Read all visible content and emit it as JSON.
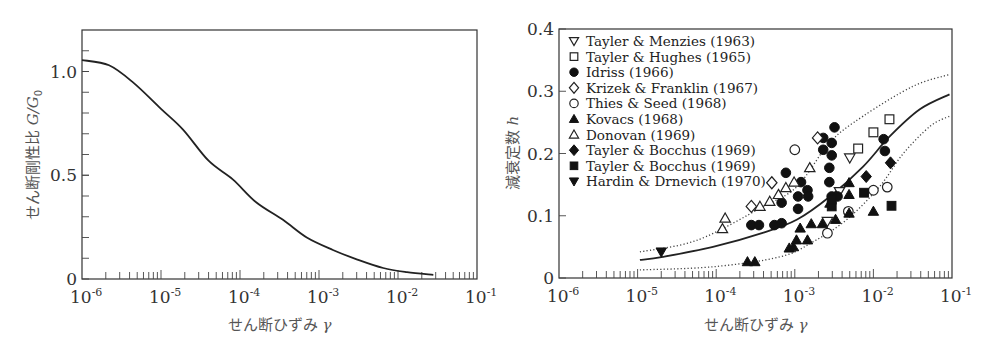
{
  "chart_data": [
    {
      "type": "line",
      "title": "",
      "xlabel": "せん断ひずみ γ",
      "ylabel": "せん断剛性比 G/G0",
      "ylabel_parts": {
        "text": "せん断剛性比 ",
        "var": "G/G",
        "sub": "0"
      },
      "xlabel_parts": {
        "text": "せん断ひずみ ",
        "var": "γ"
      },
      "xscale": "log",
      "xlim": [
        1e-06,
        0.1
      ],
      "ylim": [
        0,
        1.2
      ],
      "xticks": [
        {
          "base": "10",
          "exp": "-6"
        },
        {
          "base": "10",
          "exp": "-5"
        },
        {
          "base": "10",
          "exp": "-4"
        },
        {
          "base": "10",
          "exp": "-3"
        },
        {
          "base": "10",
          "exp": "-2"
        },
        {
          "base": "10",
          "exp": "-1"
        }
      ],
      "yticks": [
        {
          "value": 0,
          "label": "0"
        },
        {
          "value": 0.5,
          "label": "0.5"
        },
        {
          "value": 1.0,
          "label": "1.0"
        }
      ],
      "y_minor_step": 0.1,
      "grid": false,
      "series": [
        {
          "name": "G/G0",
          "style": "solid",
          "points": [
            [
              1e-06,
              1.055
            ],
            [
              2.2e-06,
              1.03
            ],
            [
              4.5e-06,
              0.945
            ],
            [
              1e-05,
              0.82
            ],
            [
              1.9e-05,
              0.72
            ],
            [
              4e-05,
              0.57
            ],
            [
              8.1e-05,
              0.48
            ],
            [
              0.00016,
              0.37
            ],
            [
              0.00035,
              0.285
            ],
            [
              0.0007,
              0.2
            ],
            [
              0.0015,
              0.14
            ],
            [
              0.003,
              0.095
            ],
            [
              0.0065,
              0.053
            ],
            [
              0.013,
              0.033
            ],
            [
              0.028,
              0.02
            ]
          ]
        }
      ]
    },
    {
      "type": "scatter",
      "title": "",
      "xlabel": "せん断ひずみ γ",
      "ylabel": "減衰定数 h",
      "ylabel_parts": {
        "text": "減衰定数 ",
        "var": "h"
      },
      "xlabel_parts": {
        "text": "せん断ひずみ ",
        "var": "γ"
      },
      "xscale": "log",
      "xlim": [
        1e-06,
        0.1
      ],
      "ylim": [
        0,
        0.4
      ],
      "xticks": [
        {
          "base": "10",
          "exp": "-6"
        },
        {
          "base": "10",
          "exp": "-5"
        },
        {
          "base": "10",
          "exp": "-4"
        },
        {
          "base": "10",
          "exp": "-3"
        },
        {
          "base": "10",
          "exp": "-2"
        },
        {
          "base": "10",
          "exp": "-1"
        }
      ],
      "yticks": [
        {
          "value": 0,
          "label": "0"
        },
        {
          "value": 0.1,
          "label": "0.1"
        },
        {
          "value": 0.2,
          "label": "0.2"
        },
        {
          "value": 0.3,
          "label": "0.3"
        },
        {
          "value": 0.4,
          "label": "0.4"
        }
      ],
      "grid": false,
      "legend_position": "top-left",
      "curves": [
        {
          "name": "mean",
          "style": "solid",
          "points": [
            [
              1.07e-05,
              0.029
            ],
            [
              2.1e-05,
              0.034
            ],
            [
              9.1e-05,
              0.05
            ],
            [
              0.0004,
              0.073
            ],
            [
              0.00107,
              0.094
            ],
            [
              0.0028,
              0.131
            ],
            [
              0.0074,
              0.179
            ],
            [
              0.016,
              0.227
            ],
            [
              0.039,
              0.271
            ],
            [
              0.093,
              0.295
            ]
          ]
        },
        {
          "name": "upper bound",
          "style": "dotted",
          "points": [
            [
              1.07e-05,
              0.042
            ],
            [
              5.8e-05,
              0.061
            ],
            [
              0.0004,
              0.115
            ],
            [
              0.00107,
              0.147
            ],
            [
              0.0028,
              0.218
            ],
            [
              0.0074,
              0.26
            ],
            [
              0.032,
              0.308
            ],
            [
              0.093,
              0.327
            ]
          ]
        },
        {
          "name": "lower bound",
          "style": "dotted",
          "points": [
            [
              1.07e-05,
              0.013
            ],
            [
              9.1e-05,
              0.018
            ],
            [
              0.00065,
              0.034
            ],
            [
              0.0017,
              0.058
            ],
            [
              0.0046,
              0.094
            ],
            [
              0.012,
              0.147
            ],
            [
              0.024,
              0.2
            ],
            [
              0.053,
              0.244
            ],
            [
              0.093,
              0.26
            ]
          ]
        }
      ],
      "series": [
        {
          "name": "Tayler & Menzies (1963)",
          "marker": "triangle-down-open",
          "points": [
            [
              0.005,
              0.193
            ],
            [
              0.0026,
              0.091
            ],
            [
              0.0037,
              0.139
            ]
          ]
        },
        {
          "name": "Tayler & Hughes (1965)",
          "marker": "square-open",
          "points": [
            [
              0.016,
              0.255
            ],
            [
              0.01,
              0.234
            ],
            [
              0.0064,
              0.208
            ]
          ]
        },
        {
          "name": "Idriss (1966)",
          "marker": "circle-filled",
          "points": [
            [
              0.0032,
              0.242
            ],
            [
              0.0023,
              0.225
            ],
            [
              0.00295,
              0.217
            ],
            [
              0.0023,
              0.206
            ],
            [
              0.00295,
              0.197
            ],
            [
              0.00275,
              0.177
            ],
            [
              0.00275,
              0.154
            ],
            [
              0.00077,
              0.169
            ],
            [
              0.0012,
              0.154
            ],
            [
              0.00145,
              0.141
            ],
            [
              0.00148,
              0.131
            ],
            [
              0.0011,
              0.131
            ],
            [
              0.00068,
              0.121
            ],
            [
              0.0011,
              0.111
            ],
            [
              0.00028,
              0.085
            ],
            [
              0.00035,
              0.085
            ],
            [
              0.00055,
              0.085
            ],
            [
              0.00068,
              0.088
            ],
            [
              0.00295,
              0.131
            ],
            [
              0.0035,
              0.131
            ],
            [
              0.0135,
              0.223
            ],
            [
              0.014,
              0.204
            ]
          ]
        },
        {
          "name": "Krizek & Franklin (1967)",
          "marker": "diamond-open",
          "points": [
            [
              0.00195,
              0.225
            ],
            [
              0.00051,
              0.153
            ],
            [
              0.00028,
              0.115
            ]
          ]
        },
        {
          "name": "Thies & Seed (1968)",
          "marker": "circle-open",
          "points": [
            [
              0.001,
              0.206
            ],
            [
              0.01,
              0.141
            ],
            [
              0.015,
              0.146
            ],
            [
              0.0048,
              0.107
            ],
            [
              0.0026,
              0.072
            ]
          ]
        },
        {
          "name": "Kovacs (1968)",
          "marker": "triangle-up-filled",
          "points": [
            [
              0.00025,
              0.026
            ],
            [
              0.00031,
              0.026
            ],
            [
              0.00085,
              0.048
            ],
            [
              0.00096,
              0.05
            ],
            [
              0.00105,
              0.061
            ],
            [
              0.00117,
              0.08
            ],
            [
              0.00145,
              0.061
            ],
            [
              0.00162,
              0.087
            ],
            [
              0.00224,
              0.087
            ],
            [
              0.0033,
              0.094
            ],
            [
              0.0049,
              0.153
            ],
            [
              0.0049,
              0.134
            ],
            [
              0.0049,
              0.104
            ],
            [
              0.01,
              0.107
            ],
            [
              0.0028,
              0.12
            ]
          ]
        },
        {
          "name": "Donovan (1969)",
          "marker": "triangle-up-open",
          "points": [
            [
              0.00012,
              0.079
            ],
            [
              0.00013,
              0.096
            ],
            [
              0.00036,
              0.115
            ],
            [
              0.00048,
              0.123
            ],
            [
              0.00062,
              0.134
            ],
            [
              0.00077,
              0.145
            ],
            [
              0.00098,
              0.154
            ],
            [
              0.00155,
              0.177
            ]
          ]
        },
        {
          "name": "Tayler & Bocchus (1969)",
          "marker": "diamond-filled",
          "points": [
            [
              0.0081,
              0.163
            ],
            [
              0.0165,
              0.185
            ]
          ]
        },
        {
          "name": "Tayler & Bocchus (1969)",
          "marker": "square-filled",
          "points": [
            [
              0.0076,
              0.137
            ],
            [
              0.017,
              0.116
            ],
            [
              0.00295,
              0.115
            ],
            [
              0.00295,
              0.126
            ]
          ]
        },
        {
          "name": "Hardin & Drnevich (1970)",
          "marker": "triangle-down-filled",
          "points": [
            [
              2e-05,
              0.042
            ]
          ]
        }
      ]
    }
  ]
}
